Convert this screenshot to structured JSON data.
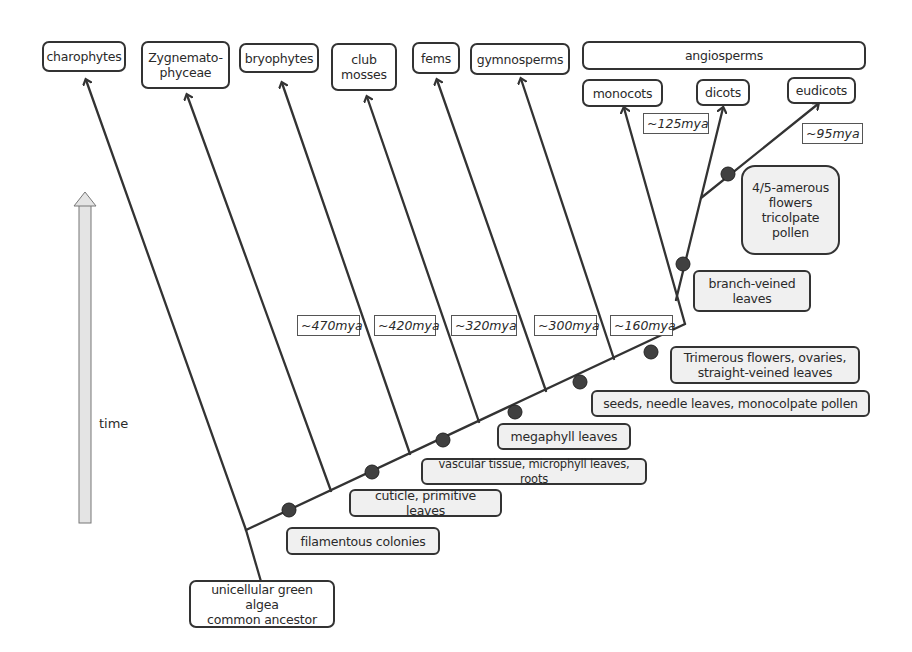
{
  "taxa": {
    "charophytes": "charophytes",
    "zygnematophyceae": "Zygnemato-\nphyceae",
    "bryophytes": "bryophytes",
    "club_mosses": "club\nmosses",
    "ferns": "fems",
    "gymnosperms": "gymnosperms",
    "angiosperms": "angiosperms",
    "monocots": "monocots",
    "dicots": "dicots",
    "eudicots": "eudicots"
  },
  "dates": {
    "d470": "~470mya",
    "d420": "~420mya",
    "d320": "~320mya",
    "d300": "~300mya",
    "d160": "~160mya",
    "d125": "~125mya",
    "d95": "~95mya"
  },
  "traits": {
    "filamentous": "filamentous colonies",
    "cuticle": "cuticle, primitive leaves",
    "vascular": "vascular tissue, microphyll leaves, roots",
    "megaphyll": "megaphyll leaves",
    "seeds": "seeds, needle leaves, monocolpate pollen",
    "trimerous": "Trimerous flowers, ovaries,\nstraight-veined leaves",
    "branch_veined": "branch-veined\nleaves",
    "tetramerous": "4/5-amerous\nflowers\ntricolpate\npollen"
  },
  "root": "unicellular green algea\ncommon ancestor",
  "axis": {
    "label": "time"
  },
  "colors": {
    "line": "#333333",
    "node": "#404040",
    "trait_fill": "#f0f0f0",
    "time_arrow": "#e0e0e0"
  }
}
